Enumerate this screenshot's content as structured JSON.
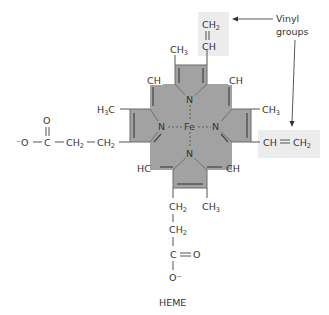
{
  "figure": {
    "caption": "HEME",
    "annotation": "Vinyl groups",
    "annotation_lines": [
      "Vinyl",
      "groups"
    ],
    "colors": {
      "ring_fill": "#a2a2a2",
      "highlight": "#ececec",
      "ink": "#333333"
    }
  },
  "atoms": {
    "center": "Fe",
    "nitrogen": "N",
    "ch": "CH",
    "hc": "HC",
    "c": "C",
    "o": "O",
    "o_minus_left": "⁻O",
    "o_minus_bottom": "O⁻",
    "ch_base": "CH",
    "sub2": "2",
    "sub3": "3",
    "h3c_h": "H",
    "h3c_c": "C"
  },
  "groups": {
    "top_vinyl": {
      "upper": "CH2",
      "lower": "CH"
    },
    "right_vinyl": "CH = CH2",
    "methyls": [
      "CH3",
      "H3C",
      "CH3",
      "CH3"
    ],
    "propionates": [
      "-O-C(=O)-CH2-CH2-",
      "CH2-CH2-C(=O)-O-"
    ]
  }
}
